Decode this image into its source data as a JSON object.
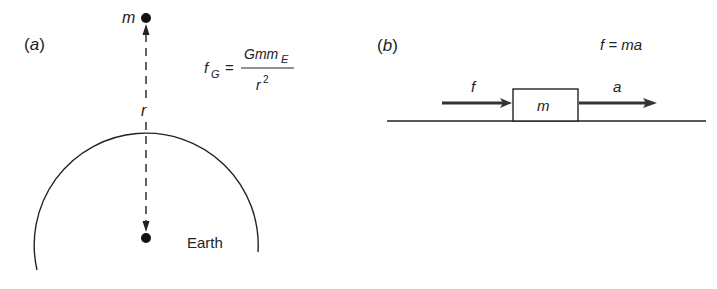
{
  "panel_a": {
    "label": "(a)",
    "mass_label": "m",
    "distance_label": "r",
    "body_label": "Earth",
    "formula": {
      "lhs": "f",
      "lhs_sub": "G",
      "equals": "=",
      "numerator": "Gmm",
      "numerator_sub": "E",
      "denominator": "r",
      "denominator_sup": "2"
    }
  },
  "panel_b": {
    "label": "(b)",
    "formula": "f = ma",
    "force_label": "f",
    "block_label": "m",
    "accel_label": "a"
  },
  "colors": {
    "ink": "#222222",
    "background": "#ffffff"
  }
}
